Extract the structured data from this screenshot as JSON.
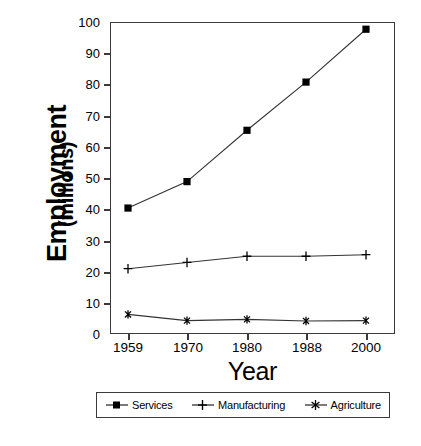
{
  "chart_data": {
    "type": "line",
    "title": "",
    "xlabel": "Year",
    "ylabel": "Employment (millions)",
    "ylabel_main": "Employment",
    "ylabel_sub": "(millions)",
    "categories": [
      "1959",
      "1970",
      "1980",
      "1988",
      "2000"
    ],
    "x": [
      1959,
      1970,
      1980,
      1988,
      2000
    ],
    "ylim": [
      0,
      100
    ],
    "ytick_values": [
      0,
      10,
      20,
      30,
      40,
      50,
      60,
      70,
      80,
      90,
      100
    ],
    "ytick_labels": [
      "0",
      "10",
      "20",
      "30",
      "40",
      "50",
      "60",
      "70",
      "80",
      "90",
      "100"
    ],
    "grid": false,
    "legend_position": "below-plot",
    "series": [
      {
        "name": "Services",
        "marker": "filled-square",
        "values": [
          40.5,
          49.0,
          65.5,
          81.0,
          98.0
        ]
      },
      {
        "name": "Manufacturing",
        "marker": "plus",
        "values": [
          21.0,
          23.0,
          25.0,
          25.0,
          25.5
        ]
      },
      {
        "name": "Agriculture",
        "marker": "asterisk",
        "values": [
          6.3,
          4.3,
          4.7,
          4.2,
          4.3
        ]
      }
    ]
  },
  "legend": {
    "items": [
      {
        "label": "Services",
        "marker": "filled-square-marker-icon"
      },
      {
        "label": "Manufacturing",
        "marker": "plus-marker-icon"
      },
      {
        "label": "Agriculture",
        "marker": "asterisk-marker-icon"
      }
    ]
  },
  "axes": {
    "x_title": "Year",
    "y_title_main": "Employment",
    "y_title_sub": "(millions)",
    "x_tick_labels": [
      "1959",
      "1970",
      "1980",
      "1988",
      "2000"
    ],
    "y_tick_labels": [
      "100",
      "90",
      "80",
      "70",
      "60",
      "50",
      "40",
      "30",
      "20",
      "10",
      "0"
    ]
  },
  "caption": "",
  "colors": {
    "line": "#333333",
    "axis": "#3a3a3a",
    "background": "#ffffff",
    "text": "#000000"
  }
}
